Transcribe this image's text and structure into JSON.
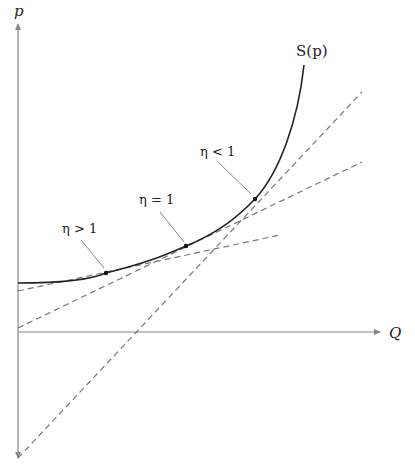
{
  "diagram": {
    "axes": {
      "y_label": "p",
      "x_label": "Q"
    },
    "curve": {
      "label": "S(p)"
    },
    "annotations": [
      {
        "label": "η > 1"
      },
      {
        "label": "η = 1"
      },
      {
        "label": "η < 1"
      }
    ],
    "colors": {
      "axis": "#888888",
      "curve": "#222222",
      "dashed": "#777777",
      "leader": "#666666"
    }
  }
}
